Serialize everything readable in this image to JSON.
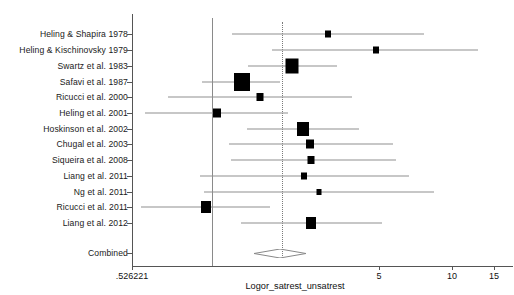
{
  "chart_data": {
    "type": "forest",
    "title": "",
    "xlabel": "Logor_satrest_unsatrest",
    "ylabel": "",
    "xticks": [
      {
        "label": ".526221",
        "value": 0.526221,
        "px": 132
      },
      {
        "label": "5",
        "value": 5,
        "px": 379
      },
      {
        "label": "10",
        "value": 10,
        "px": 452
      },
      {
        "label": "15",
        "value": 15,
        "px": 494
      }
    ],
    "reference_lines": [
      {
        "name": "null-line",
        "style": "solid",
        "px": 212
      },
      {
        "name": "pooled-line",
        "style": "dotted",
        "px": 282
      }
    ],
    "grid": false,
    "legend": null,
    "studies": [
      {
        "label": "Heling & Shapira 1978",
        "est_px": 328,
        "lo_px": 232,
        "hi_px": 424,
        "box": 6,
        "y_px": 34
      },
      {
        "label": "Heling & Kischinovsky 1979",
        "est_px": 376,
        "lo_px": 272,
        "hi_px": 478,
        "box": 6,
        "y_px": 50
      },
      {
        "label": "Swartz et al. 1983",
        "est_px": 292,
        "lo_px": 248,
        "hi_px": 337,
        "box": 13,
        "y_px": 66
      },
      {
        "label": "Safavi et al. 1987",
        "est_px": 242,
        "lo_px": 202,
        "hi_px": 280,
        "box": 16,
        "y_px": 82
      },
      {
        "label": "Ricucci et al. 2000",
        "est_px": 260,
        "lo_px": 168,
        "hi_px": 352,
        "box": 7,
        "y_px": 97
      },
      {
        "label": "Heling et al. 2001",
        "est_px": 217,
        "lo_px": 145,
        "hi_px": 288,
        "box": 8,
        "y_px": 113
      },
      {
        "label": "Hoskinson et al. 2002",
        "est_px": 303,
        "lo_px": 247,
        "hi_px": 359,
        "box": 12,
        "y_px": 129
      },
      {
        "label": "Chugal et al. 2003",
        "est_px": 310,
        "lo_px": 229,
        "hi_px": 393,
        "box": 8,
        "y_px": 144
      },
      {
        "label": "Siqueira et al. 2008",
        "est_px": 311,
        "lo_px": 231,
        "hi_px": 396,
        "box": 7,
        "y_px": 160
      },
      {
        "label": "Liang et al. 2011",
        "est_px": 304,
        "lo_px": 200,
        "hi_px": 409,
        "box": 6,
        "y_px": 176
      },
      {
        "label": "Ng et al. 2011",
        "est_px": 319,
        "lo_px": 204,
        "hi_px": 434,
        "box": 5,
        "y_px": 192
      },
      {
        "label": "Ricucci et al. 2011",
        "est_px": 206,
        "lo_px": 141,
        "hi_px": 270,
        "box": 10,
        "y_px": 207
      },
      {
        "label": "Liang et al. 2012",
        "est_px": 311,
        "lo_px": 241,
        "hi_px": 382,
        "box": 10,
        "y_px": 223
      }
    ],
    "combined": {
      "label": "Combined",
      "est_px": 280,
      "lo_px": 254,
      "hi_px": 306,
      "y_px": 253
    }
  },
  "axis": {
    "x_title": "Logor_satrest_unsatrest"
  }
}
